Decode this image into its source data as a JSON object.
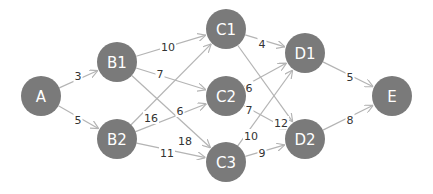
{
  "diagram": {
    "type": "directed-weighted-graph",
    "colors": {
      "node_fill": "#7a7a7a",
      "node_text": "#ffffff",
      "edge": "#b4b4b4",
      "edge_label": "#333333",
      "background": "#ffffff"
    },
    "nodes": [
      {
        "id": "A",
        "label": "A",
        "x": 41,
        "y": 96
      },
      {
        "id": "B1",
        "label": "B1",
        "x": 117,
        "y": 62
      },
      {
        "id": "B2",
        "label": "B2",
        "x": 117,
        "y": 139
      },
      {
        "id": "C1",
        "label": "C1",
        "x": 226,
        "y": 29
      },
      {
        "id": "C2",
        "label": "C2",
        "x": 226,
        "y": 96
      },
      {
        "id": "C3",
        "label": "C3",
        "x": 226,
        "y": 162
      },
      {
        "id": "D1",
        "label": "D1",
        "x": 305,
        "y": 53
      },
      {
        "id": "D2",
        "label": "D2",
        "x": 305,
        "y": 139
      },
      {
        "id": "E",
        "label": "E",
        "x": 392,
        "y": 96
      }
    ],
    "edges": [
      {
        "from": "A",
        "to": "B1",
        "weight": "3",
        "lx": 78,
        "ly": 76
      },
      {
        "from": "A",
        "to": "B2",
        "weight": "5",
        "lx": 78,
        "ly": 120
      },
      {
        "from": "B1",
        "to": "C1",
        "weight": "10",
        "lx": 168,
        "ly": 47
      },
      {
        "from": "B1",
        "to": "C2",
        "weight": "7",
        "lx": 160,
        "ly": 74
      },
      {
        "from": "B1",
        "to": "C3",
        "weight": "18",
        "lx": 185,
        "ly": 141
      },
      {
        "from": "B2",
        "to": "C1",
        "weight": "16",
        "lx": 151,
        "ly": 118
      },
      {
        "from": "B2",
        "to": "C2",
        "weight": "6",
        "lx": 180,
        "ly": 111
      },
      {
        "from": "B2",
        "to": "C3",
        "weight": "11",
        "lx": 167,
        "ly": 153
      },
      {
        "from": "C1",
        "to": "D1",
        "weight": "4",
        "lx": 262,
        "ly": 44
      },
      {
        "from": "C1",
        "to": "D2",
        "weight": "12",
        "lx": 281,
        "ly": 123
      },
      {
        "from": "C2",
        "to": "D1",
        "weight": "6",
        "lx": 249,
        "ly": 88
      },
      {
        "from": "C2",
        "to": "D2",
        "weight": "7",
        "lx": 249,
        "ly": 110
      },
      {
        "from": "C3",
        "to": "D1",
        "weight": "10",
        "lx": 251,
        "ly": 136
      },
      {
        "from": "C3",
        "to": "D2",
        "weight": "9",
        "lx": 262,
        "ly": 153
      },
      {
        "from": "D1",
        "to": "E",
        "weight": "5",
        "lx": 350,
        "ly": 77
      },
      {
        "from": "D2",
        "to": "E",
        "weight": "8",
        "lx": 350,
        "ly": 120
      }
    ],
    "node_radius": 20
  }
}
